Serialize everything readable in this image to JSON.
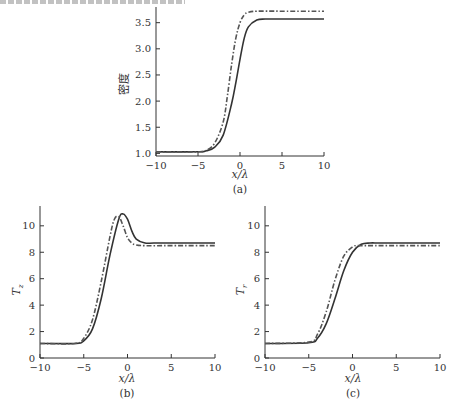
{
  "chart_data": [
    {
      "panel": "(a)",
      "type": "line",
      "title": "",
      "xlabel": "x/λ",
      "ylabel": "密度",
      "xlim": [
        -10,
        10
      ],
      "ylim": [
        0.95,
        3.8
      ],
      "xticks": [
        -10,
        -5,
        0,
        5,
        10
      ],
      "yticks": [
        1.0,
        1.5,
        2.0,
        2.5,
        3.0,
        3.5
      ],
      "ytick_labels": [
        "1.0",
        "1.5",
        "2.0",
        "2.5",
        "3.0",
        "3.5"
      ],
      "grid": false,
      "legend": null,
      "series": [
        {
          "name": "solid",
          "style": "solid",
          "x": [
            -10,
            -5,
            -4,
            -3,
            -2,
            -1,
            -0.5,
            0,
            0.5,
            1,
            2,
            3,
            5,
            10
          ],
          "values": [
            1.03,
            1.03,
            1.05,
            1.12,
            1.35,
            1.95,
            2.35,
            2.8,
            3.2,
            3.42,
            3.55,
            3.57,
            3.57,
            3.57
          ]
        },
        {
          "name": "dash-dot",
          "style": "dashdot",
          "x": [
            -10,
            -5,
            -4,
            -3,
            -2,
            -1.5,
            -1,
            -0.5,
            0,
            0.5,
            1,
            2,
            5,
            10
          ],
          "values": [
            1.03,
            1.03,
            1.06,
            1.2,
            1.6,
            2.1,
            2.7,
            3.2,
            3.5,
            3.65,
            3.7,
            3.72,
            3.72,
            3.72
          ]
        }
      ],
      "caption": "(a)"
    },
    {
      "panel": "(b)",
      "type": "line",
      "title": "",
      "xlabel": "x/λ",
      "ylabel": "T_z",
      "xlim": [
        -10,
        10
      ],
      "ylim": [
        0,
        11.5
      ],
      "xticks": [
        -10,
        -5,
        0,
        5,
        10
      ],
      "yticks": [
        0,
        2,
        4,
        6,
        8,
        10
      ],
      "grid": false,
      "legend": null,
      "series": [
        {
          "name": "solid",
          "style": "solid",
          "x": [
            -10,
            -6,
            -5,
            -4,
            -3,
            -2,
            -1,
            -0.5,
            0,
            0.5,
            1,
            2,
            3,
            5,
            10
          ],
          "values": [
            1.1,
            1.1,
            1.3,
            2.2,
            4.5,
            7.8,
            10.5,
            10.9,
            10.5,
            9.6,
            9.0,
            8.7,
            8.7,
            8.7,
            8.7
          ]
        },
        {
          "name": "dash-dot",
          "style": "dashdot",
          "x": [
            -10,
            -6,
            -5,
            -4,
            -3,
            -2,
            -1.5,
            -1,
            -0.5,
            0,
            0.5,
            1,
            2,
            5,
            10
          ],
          "values": [
            1.1,
            1.1,
            1.5,
            2.9,
            5.8,
            9.2,
            10.5,
            10.7,
            10.0,
            9.1,
            8.7,
            8.55,
            8.5,
            8.5,
            8.5
          ]
        }
      ],
      "caption": "(b)"
    },
    {
      "panel": "(c)",
      "type": "line",
      "title": "",
      "xlabel": "x/λ",
      "ylabel": "T_r",
      "xlim": [
        -10,
        10
      ],
      "ylim": [
        0,
        11.5
      ],
      "xticks": [
        -10,
        -5,
        0,
        5,
        10
      ],
      "yticks": [
        0,
        2,
        4,
        6,
        8,
        10
      ],
      "grid": false,
      "legend": null,
      "series": [
        {
          "name": "solid",
          "style": "solid",
          "x": [
            -10,
            -5,
            -4,
            -3,
            -2,
            -1,
            0,
            1,
            2,
            3,
            5,
            10
          ],
          "values": [
            1.1,
            1.15,
            1.5,
            2.6,
            4.5,
            6.6,
            8.0,
            8.6,
            8.7,
            8.7,
            8.7,
            8.7
          ]
        },
        {
          "name": "dash-dot",
          "style": "dashdot",
          "x": [
            -10,
            -5,
            -4,
            -3,
            -2,
            -1,
            0,
            0.5,
            1,
            2,
            5,
            10
          ],
          "values": [
            1.1,
            1.2,
            1.8,
            3.5,
            5.9,
            7.7,
            8.4,
            8.5,
            8.5,
            8.5,
            8.5,
            8.5
          ]
        }
      ],
      "caption": "(c)"
    }
  ],
  "labels": {
    "a_caption": "(a)",
    "b_caption": "(b)",
    "c_caption": "(c)",
    "a_xlabel": "x/λ",
    "b_xlabel": "x/λ",
    "c_xlabel": "x/λ",
    "a_ylabel": "密度",
    "b_ylabel": "T",
    "b_ylabel_sub": "z",
    "c_ylabel": "T",
    "c_ylabel_sub": "r"
  },
  "colors": {
    "axis": "#333333",
    "solid_line": "#333333",
    "dashdot_line": "#555555"
  }
}
